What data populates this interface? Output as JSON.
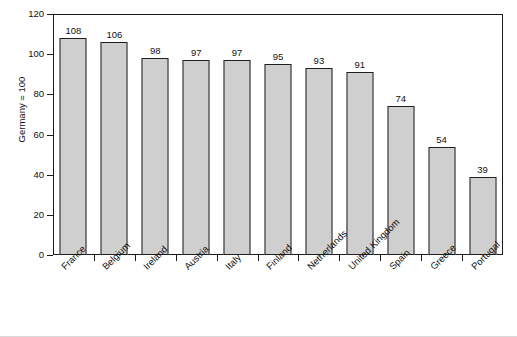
{
  "chart_data": {
    "type": "bar",
    "title": "",
    "subtitle": "",
    "xlabel": "",
    "ylabel": "Germany = 100",
    "ylim": [
      0,
      120
    ],
    "yticks": [
      0,
      20,
      40,
      60,
      80,
      100,
      120
    ],
    "grid": false,
    "legend": null,
    "bar_color": "#cfcfcf",
    "bar_edge_color": "#1f1f1f",
    "categories": [
      "France",
      "Belgium",
      "Ireland",
      "Austria",
      "Italy",
      "Finland",
      "Netherlands",
      "United Kingdom",
      "Spain",
      "Greece",
      "Portugal"
    ],
    "values": [
      108,
      106,
      98,
      97,
      97,
      95,
      93,
      91,
      74,
      54,
      39
    ],
    "data_labels": [
      "108",
      "106",
      "98",
      "97",
      "97",
      "95",
      "93",
      "91",
      "74",
      "54",
      "39"
    ],
    "ytick_labels": [
      "0",
      "20",
      "40",
      "60",
      "80",
      "100",
      "120"
    ]
  }
}
